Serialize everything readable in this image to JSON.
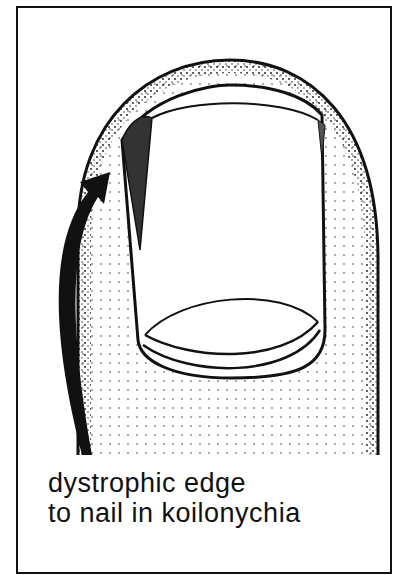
{
  "figure": {
    "caption_lines": [
      "dystrophic edge",
      "to nail in koilonychia"
    ],
    "colors": {
      "ink": "#111111",
      "background": "#ffffff"
    }
  }
}
